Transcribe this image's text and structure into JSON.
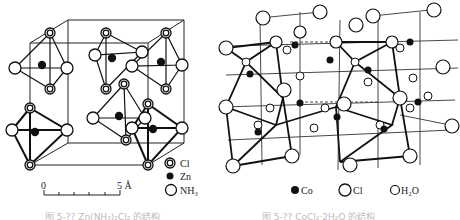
{
  "figures": [
    {
      "id": "left",
      "subject": "Zn(NH3)2Cl2 crystal structure",
      "legend": [
        {
          "symbol": "double-ring",
          "label": "Cl"
        },
        {
          "symbol": "filled",
          "label": "Zn"
        },
        {
          "symbol": "open",
          "label": "NH₃"
        }
      ],
      "scale_bar": {
        "start": "0",
        "end": "5 Å"
      },
      "caption": "图 5-?? Zn(NH₃)₂Cl₂ 的结构"
    },
    {
      "id": "right",
      "subject": "CoCl2·2H2O crystal structure",
      "legend": [
        {
          "symbol": "filled",
          "label": "Co"
        },
        {
          "symbol": "open-large",
          "label": "Cl"
        },
        {
          "symbol": "open-small",
          "label": "H₂O"
        }
      ],
      "caption": "图 5-?? CoCl₂·2H₂O 的结构"
    }
  ]
}
